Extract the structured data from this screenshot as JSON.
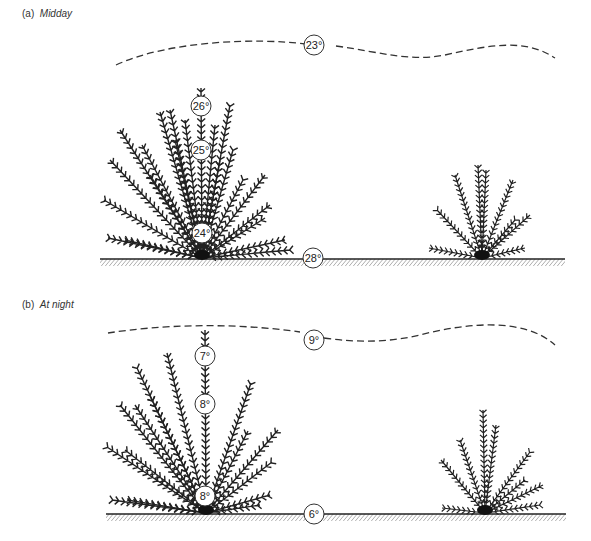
{
  "panels": [
    {
      "id": "a",
      "prefix": "(a)",
      "title": "Midday",
      "readings": {
        "air": "23°",
        "plant_top": "26°",
        "plant_mid": "25°",
        "plant_base": "24°",
        "ground": "28°"
      }
    },
    {
      "id": "b",
      "prefix": "(b)",
      "title": "At night",
      "readings": {
        "air": "9°",
        "plant_top": "7°",
        "plant_mid": "8°",
        "plant_base": "8°",
        "ground": "6°"
      }
    }
  ],
  "colors": {
    "ink": "#222222",
    "background": "#ffffff"
  }
}
